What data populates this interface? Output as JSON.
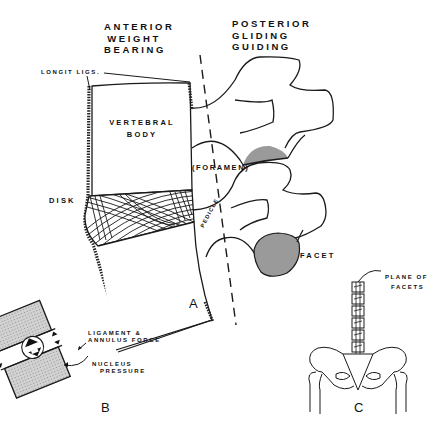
{
  "figure": {
    "panels": [
      {
        "id": "A",
        "label": "A"
      },
      {
        "id": "B",
        "label": "B"
      },
      {
        "id": "C",
        "label": "C"
      }
    ]
  },
  "panel_a": {
    "heading_anterior": [
      "ANTERIOR",
      "WEIGHT",
      "BEARING"
    ],
    "heading_posterior": [
      "POSTERIOR",
      "GLIDING",
      "GUIDING"
    ],
    "labels": {
      "longit_ligs": "LONGIT  LIGS.",
      "vertebral_body_line1": "VERTEBRAL",
      "vertebral_body_line2": "BODY",
      "disk": "DISK",
      "foramen": "(FORAMEN)",
      "pedicle": "PEDICLE",
      "facet": "FACET"
    },
    "colors": {
      "facet_fill": "#9a9a9a",
      "line": "#1a1a1a"
    }
  },
  "panel_b": {
    "labels": {
      "ligament_line1": "LIGAMENT &",
      "ligament_line2": "ANNULUS FORCE",
      "nucleus_line1": "NUCLEUS",
      "nucleus_line2": "PRESSURE"
    },
    "colors": {
      "body_fill": "#c8c8c8"
    }
  },
  "panel_c": {
    "labels": {
      "plane_line1": "PLANE OF",
      "plane_line2": "FACETS"
    }
  }
}
